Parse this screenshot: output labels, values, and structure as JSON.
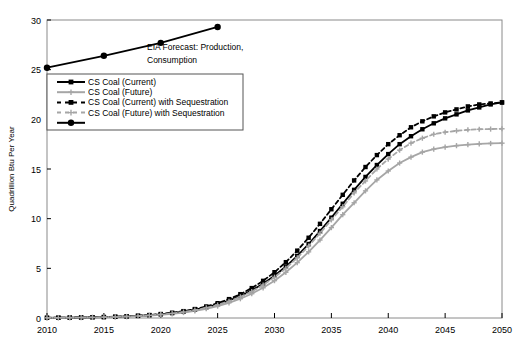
{
  "chart_data": {
    "type": "line",
    "title": "",
    "xlabel": "",
    "ylabel": "Quadrillion Btu Per Year",
    "xlim": [
      2010,
      2050
    ],
    "ylim": [
      0,
      30
    ],
    "xticks": [
      2010,
      2015,
      2020,
      2025,
      2030,
      2035,
      2040,
      2045,
      2050
    ],
    "yticks": [
      0,
      5,
      10,
      15,
      20,
      25,
      30
    ],
    "grid": false,
    "legend_position": "upper-left-inside",
    "annotations": [
      {
        "name": "eia-forecast-annotation",
        "line1": "EIA Forecast:  Production,",
        "line2": "Consumption"
      }
    ],
    "series": [
      {
        "name": "EIA Forecast: Production, Consumption",
        "color": "#000000",
        "style": "solid",
        "marker": "circle",
        "in_legend": false,
        "x": [
          2010,
          2015,
          2020,
          2025
        ],
        "values": [
          25.2,
          26.4,
          27.7,
          29.3
        ]
      },
      {
        "name": "CS Coal (Current)",
        "color": "#000000",
        "style": "solid",
        "marker": "square",
        "in_legend": true,
        "x": [
          2010,
          2011,
          2012,
          2013,
          2014,
          2015,
          2016,
          2017,
          2018,
          2019,
          2020,
          2021,
          2022,
          2023,
          2024,
          2025,
          2026,
          2027,
          2028,
          2029,
          2030,
          2031,
          2032,
          2033,
          2034,
          2035,
          2036,
          2037,
          2038,
          2039,
          2040,
          2041,
          2042,
          2043,
          2044,
          2045,
          2046,
          2047,
          2048,
          2049,
          2050
        ],
        "values": [
          0.02,
          0.03,
          0.04,
          0.05,
          0.07,
          0.09,
          0.12,
          0.16,
          0.21,
          0.28,
          0.37,
          0.49,
          0.64,
          0.84,
          1.08,
          1.38,
          1.76,
          2.22,
          2.78,
          3.45,
          4.25,
          5.18,
          6.25,
          7.45,
          8.75,
          10.1,
          11.5,
          12.9,
          14.2,
          15.4,
          16.5,
          17.5,
          18.3,
          19.0,
          19.6,
          20.1,
          20.5,
          20.9,
          21.2,
          21.5,
          21.7
        ]
      },
      {
        "name": "CS Coal (Future)",
        "color": "#a6a6a6",
        "style": "solid",
        "marker": "plus",
        "in_legend": true,
        "x": [
          2010,
          2011,
          2012,
          2013,
          2014,
          2015,
          2016,
          2017,
          2018,
          2019,
          2020,
          2021,
          2022,
          2023,
          2024,
          2025,
          2026,
          2027,
          2028,
          2029,
          2030,
          2031,
          2032,
          2033,
          2034,
          2035,
          2036,
          2037,
          2038,
          2039,
          2040,
          2041,
          2042,
          2043,
          2044,
          2045,
          2046,
          2047,
          2048,
          2049,
          2050
        ],
        "values": [
          0.02,
          0.02,
          0.03,
          0.04,
          0.06,
          0.08,
          0.1,
          0.13,
          0.18,
          0.24,
          0.32,
          0.42,
          0.55,
          0.72,
          0.93,
          1.2,
          1.53,
          1.94,
          2.44,
          3.04,
          3.76,
          4.6,
          5.57,
          6.66,
          7.85,
          9.1,
          10.4,
          11.6,
          12.8,
          13.9,
          14.8,
          15.6,
          16.2,
          16.7,
          17.0,
          17.2,
          17.35,
          17.45,
          17.52,
          17.57,
          17.6
        ]
      },
      {
        "name": "CS Coal (Current) with Sequestration",
        "color": "#000000",
        "style": "dashed",
        "marker": "square",
        "in_legend": true,
        "x": [
          2010,
          2011,
          2012,
          2013,
          2014,
          2015,
          2016,
          2017,
          2018,
          2019,
          2020,
          2021,
          2022,
          2023,
          2024,
          2025,
          2026,
          2027,
          2028,
          2029,
          2030,
          2031,
          2032,
          2033,
          2034,
          2035,
          2036,
          2037,
          2038,
          2039,
          2040,
          2041,
          2042,
          2043,
          2044,
          2045,
          2046,
          2047,
          2048,
          2049,
          2050
        ],
        "values": [
          0.02,
          0.03,
          0.04,
          0.06,
          0.08,
          0.1,
          0.13,
          0.17,
          0.23,
          0.3,
          0.4,
          0.53,
          0.69,
          0.9,
          1.16,
          1.49,
          1.9,
          2.4,
          3.01,
          3.74,
          4.61,
          5.62,
          6.78,
          8.08,
          9.48,
          10.95,
          12.4,
          13.85,
          15.2,
          16.4,
          17.5,
          18.4,
          19.2,
          19.8,
          20.3,
          20.7,
          21.0,
          21.3,
          21.5,
          21.6,
          21.7
        ]
      },
      {
        "name": "CS Coal (Future) with Sequestration",
        "color": "#a6a6a6",
        "style": "dashed",
        "marker": "plus",
        "in_legend": true,
        "x": [
          2010,
          2011,
          2012,
          2013,
          2014,
          2015,
          2016,
          2017,
          2018,
          2019,
          2020,
          2021,
          2022,
          2023,
          2024,
          2025,
          2026,
          2027,
          2028,
          2029,
          2030,
          2031,
          2032,
          2033,
          2034,
          2035,
          2036,
          2037,
          2038,
          2039,
          2040,
          2041,
          2042,
          2043,
          2044,
          2045,
          2046,
          2047,
          2048,
          2049,
          2050
        ],
        "values": [
          0.02,
          0.02,
          0.03,
          0.05,
          0.06,
          0.08,
          0.11,
          0.15,
          0.2,
          0.26,
          0.35,
          0.46,
          0.6,
          0.79,
          1.02,
          1.31,
          1.68,
          2.12,
          2.67,
          3.32,
          4.1,
          5.01,
          6.06,
          7.24,
          8.53,
          9.88,
          11.2,
          12.6,
          13.8,
          15.0,
          16.0,
          16.9,
          17.6,
          18.1,
          18.5,
          18.7,
          18.85,
          18.95,
          19.0,
          19.02,
          19.05
        ]
      }
    ],
    "legend_entries": [
      {
        "label": "CS Coal (Current)",
        "color": "#000000",
        "style": "solid",
        "marker": "square"
      },
      {
        "label": "CS Coal (Future)",
        "color": "#a6a6a6",
        "style": "solid",
        "marker": "plus"
      },
      {
        "label": "CS Coal (Current) with Sequestration",
        "color": "#000000",
        "style": "dashed",
        "marker": "square"
      },
      {
        "label": "CS Coal (Future) with Sequestration",
        "color": "#a6a6a6",
        "style": "dashed",
        "marker": "plus"
      },
      {
        "label": "",
        "color": "#000000",
        "style": "solid",
        "marker": "circle"
      }
    ]
  }
}
